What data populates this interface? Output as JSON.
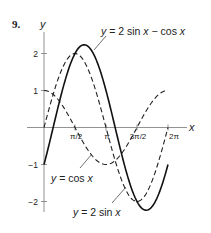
{
  "problem_number": "9.",
  "chart_data": {
    "type": "line",
    "title": "",
    "xlabel": "x",
    "ylabel": "y",
    "xlim": [
      0,
      6.2832
    ],
    "ylim": [
      -2.3,
      2.4
    ],
    "x_ticks": [
      {
        "value": 1.5708,
        "label": "π/2"
      },
      {
        "value": 3.1416,
        "label": "π"
      },
      {
        "value": 4.7124,
        "label": "3π/2"
      },
      {
        "value": 6.2832,
        "label": "2π"
      }
    ],
    "y_ticks": [
      {
        "value": 2,
        "label": "2"
      },
      {
        "value": 1,
        "label": "1"
      },
      {
        "value": -1,
        "label": "−1"
      },
      {
        "value": -2,
        "label": "−2"
      }
    ],
    "grid": false,
    "series": [
      {
        "name": "y = 2 sin x − cos x",
        "style": "solid",
        "expr": "2sin-cos",
        "x": [
          0,
          0.785,
          1.571,
          2.034,
          2.356,
          3.142,
          3.927,
          4.712,
          5.176,
          5.498,
          6.283
        ],
        "values": [
          -1,
          0.71,
          2,
          2.236,
          2.12,
          1,
          -0.71,
          -2,
          -2.236,
          -2.12,
          -1
        ]
      },
      {
        "name": "y = 2 sin x",
        "style": "dashed",
        "expr": "2sin",
        "x": [
          0,
          0.785,
          1.571,
          2.356,
          3.142,
          3.927,
          4.712,
          5.498,
          6.283
        ],
        "values": [
          0,
          1.414,
          2,
          1.414,
          0,
          -1.414,
          -2,
          -1.414,
          0
        ]
      },
      {
        "name": "y = cos x",
        "style": "dashed",
        "expr": "cos",
        "x": [
          0,
          0.785,
          1.571,
          2.356,
          3.142,
          3.927,
          4.712,
          5.498,
          6.283
        ],
        "values": [
          1,
          0.707,
          0,
          -0.707,
          -1,
          -0.707,
          0,
          0.707,
          1
        ]
      }
    ],
    "annotations": [
      {
        "text": "y = 2 sin x − cos x",
        "target": "solid curve near peak"
      },
      {
        "text": "y = cos x",
        "target": "cos curve near x≈2.2"
      },
      {
        "text": "y = 2 sin x",
        "target": "2 sin curve near x≈5"
      }
    ]
  },
  "labels": {
    "y_axis": "y",
    "x_axis": "x",
    "curve_solid": {
      "pre": "y",
      "mid": " = 2 sin ",
      "x1": "x",
      "mid2": " − cos ",
      "x2": "x"
    },
    "curve_cos": {
      "pre": "y",
      "mid": " = cos ",
      "x1": "x"
    },
    "curve_sin": {
      "pre": "y",
      "mid": " = 2 sin ",
      "x1": "x"
    }
  },
  "colors": {
    "ink": "#222222",
    "background": "#ffffff"
  }
}
